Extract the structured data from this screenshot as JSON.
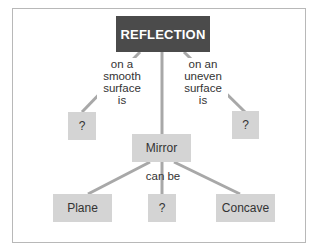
{
  "diagram": {
    "type": "concept-map",
    "root": {
      "label": "REFLECTION"
    },
    "nodes": {
      "smooth_result": {
        "label": "?"
      },
      "uneven_result": {
        "label": "?"
      },
      "mirror": {
        "label": "Mirror"
      },
      "plane": {
        "label": "Plane"
      },
      "unknown_mirror": {
        "label": "?"
      },
      "concave": {
        "label": "Concave"
      }
    },
    "link_labels": {
      "smooth": [
        "on a",
        "smooth",
        "surface",
        "is"
      ],
      "uneven": [
        "on an",
        "uneven",
        "surface",
        "is"
      ],
      "can_be": "can be"
    },
    "colors": {
      "root_fill": "#4b4b4b",
      "node_fill": "#d4d4d4",
      "line": "#a8a8a8",
      "frame": "#b8b8b8"
    }
  }
}
